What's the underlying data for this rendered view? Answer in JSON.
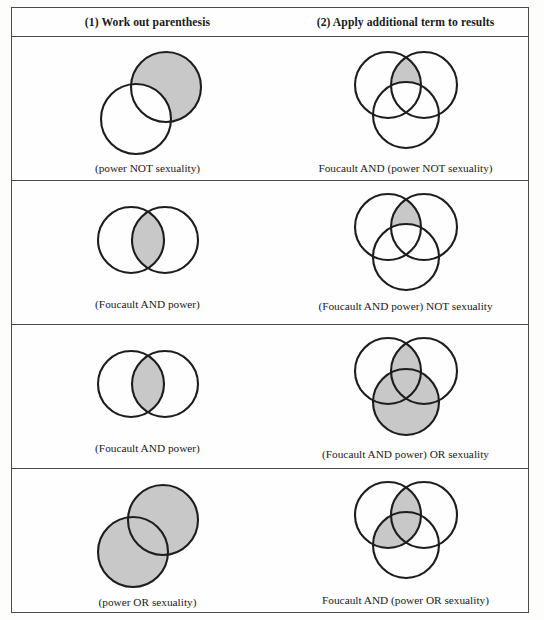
{
  "page": {
    "background_color": "#fdfdfc",
    "border_color": "#4a4a4a",
    "shade_color": "#c8c8c8",
    "stroke_color": "#1d1d1d"
  },
  "header": {
    "columns": [
      {
        "label": "(1) Work out parenthesis"
      },
      {
        "label": "(2) Apply additional term to results"
      }
    ]
  },
  "rows": [
    {
      "step1": {
        "caption": "(power NOT sexuality)",
        "diagram": "two-circle-offset",
        "shaded": "upper-right-circle-minus-overlap"
      },
      "step2": {
        "caption": "Foucault AND (power NOT sexuality)",
        "diagram": "three-circle-venn",
        "shaded": "top-lens-minus-bottom"
      }
    },
    {
      "step1": {
        "caption": "(Foucault AND power)",
        "diagram": "two-circle-horizontal",
        "shaded": "intersection-lens"
      },
      "step2": {
        "caption": "(Foucault AND power) NOT sexuality",
        "diagram": "three-circle-venn",
        "shaded": "top-lens-minus-bottom"
      }
    },
    {
      "step1": {
        "caption": "(Foucault AND power)",
        "diagram": "two-circle-horizontal",
        "shaded": "intersection-lens"
      },
      "step2": {
        "caption": "(Foucault AND power) OR sexuality",
        "diagram": "three-circle-venn",
        "shaded": "top-lens-plus-bottom-circle"
      }
    },
    {
      "step1": {
        "caption": "(power OR sexuality)",
        "diagram": "two-circle-offset",
        "shaded": "both-circles-union"
      },
      "step2": {
        "caption": "Foucault AND (power OR sexuality)",
        "diagram": "three-circle-venn",
        "shaded": "left-lens-plus-top-lens"
      }
    }
  ]
}
